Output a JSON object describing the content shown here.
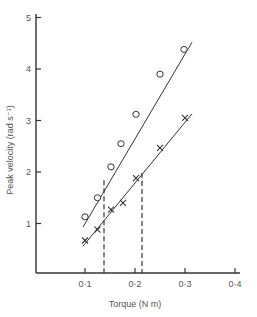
{
  "chart_data": {
    "type": "scatter",
    "title": "",
    "xlabel": "Torque (N m)",
    "ylabel": "Peak velocity (rad s⁻¹)",
    "xlim": [
      0,
      0.4
    ],
    "ylim": [
      0,
      5
    ],
    "x_ticks": [
      "0·1",
      "0·2",
      "0·3",
      "0·4"
    ],
    "x_tick_values": [
      0.1,
      0.2,
      0.3,
      0.4
    ],
    "y_ticks": [
      "1",
      "2",
      "3",
      "4",
      "5"
    ],
    "y_tick_values": [
      1,
      2,
      3,
      4,
      5
    ],
    "grid": false,
    "legend": null,
    "series": [
      {
        "name": "circles",
        "marker": "o",
        "x": [
          0.1,
          0.125,
          0.152,
          0.172,
          0.202,
          0.25,
          0.298
        ],
        "y": [
          1.13,
          1.5,
          2.1,
          2.55,
          3.12,
          3.9,
          4.38
        ],
        "fit_line": {
          "x": [
            0.096,
            0.314
          ],
          "y": [
            0.93,
            4.52
          ]
        }
      },
      {
        "name": "crosses",
        "marker": "x",
        "x": [
          0.1,
          0.125,
          0.152,
          0.176,
          0.202,
          0.25,
          0.3
        ],
        "y": [
          0.67,
          0.88,
          1.27,
          1.4,
          1.88,
          2.47,
          3.05
        ],
        "fit_line": {
          "x": [
            0.096,
            0.314
          ],
          "y": [
            0.56,
            3.13
          ]
        }
      }
    ],
    "annotations": [
      {
        "type": "dashed-vertical",
        "x": 0.138,
        "y_top": 1.84,
        "note": "drop from circles fit line"
      },
      {
        "type": "dashed-vertical",
        "x": 0.214,
        "y_top": 1.98,
        "note": "drop from crosses fit line"
      }
    ]
  }
}
